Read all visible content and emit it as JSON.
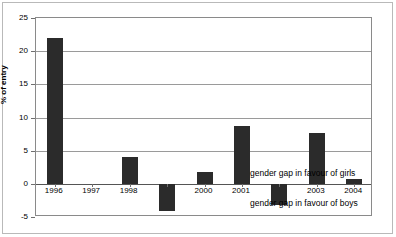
{
  "chart_data": {
    "type": "bar",
    "title": "",
    "xlabel": "",
    "ylabel": "% of entry",
    "ylim": [
      -5,
      25
    ],
    "yticks": [
      25,
      20,
      15,
      10,
      5,
      0,
      -5
    ],
    "ytick_labels": [
      "25",
      "20",
      "15",
      "10",
      "5",
      "0",
      "-5"
    ],
    "grid": true,
    "legend": "none",
    "categories": [
      "1996",
      "1997",
      "1998",
      "1999",
      "2000",
      "2001",
      "2002",
      "2003",
      "2004"
    ],
    "visible_tick_labels": [
      "1996",
      "1997",
      "1998",
      "",
      "2000",
      "2001",
      "",
      "2003",
      "2004"
    ],
    "values": [
      22.0,
      0.0,
      4.0,
      -4.1,
      1.8,
      8.7,
      -3.2,
      7.7,
      0.7
    ],
    "bar_color": "#2b2b2b",
    "annotations": [
      {
        "text": "gender gap in favour of girls",
        "x_frac": 0.635,
        "y_value": 1.6
      },
      {
        "text": "gender gap in favour of boys",
        "x_frac": 0.635,
        "y_value": -2.9
      }
    ]
  },
  "colors": {
    "bar": "#2b2b2b",
    "grid": "#9a9a9a",
    "frame": "#8a8a8a",
    "figure_border": "#b9b9b9",
    "text": "#000000"
  }
}
